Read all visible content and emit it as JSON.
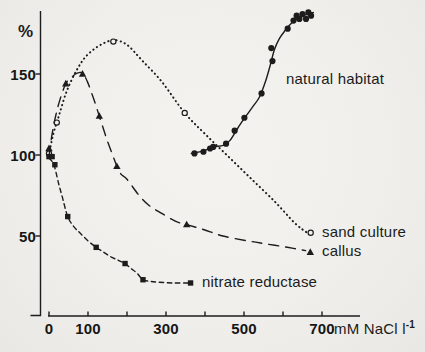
{
  "colors": {
    "ink": "#1c1c1c",
    "paper": "#f2f1ee"
  },
  "labels": {
    "natural_habitat": "natural habitat",
    "sand_culture": "sand culture",
    "callus": "callus",
    "nitrate_reductase": "nitrate reductase"
  },
  "chart_data": {
    "type": "line",
    "title": "",
    "xlabel": "mM NaCl l-1",
    "ylabel": "%",
    "xlim": [
      0,
      790
    ],
    "ylim": [
      0,
      190
    ],
    "grid": false,
    "legend_position": "inline-at-line-ends",
    "x_axis": {
      "unit_base": "mM NaCl l",
      "unit_sup": "-1",
      "tick_values": [
        0,
        100,
        200,
        300,
        400,
        500,
        600,
        700
      ],
      "label_values": [
        0,
        100,
        300,
        500,
        700
      ]
    },
    "y_axis": {
      "symbol": "%",
      "tick_values": [
        50,
        100,
        150
      ]
    },
    "series": [
      {
        "name": "natural habitat",
        "line_style": "solid",
        "marker": "filled-circle",
        "points": [
          [
            373,
            101
          ],
          [
            396,
            102
          ],
          [
            413,
            104
          ],
          [
            421,
            105
          ],
          [
            454,
            107
          ],
          [
            476,
            115
          ],
          [
            501,
            123
          ],
          [
            545,
            138
          ],
          [
            570,
            166
          ],
          [
            573,
            158
          ],
          [
            612,
            178
          ],
          [
            627,
            183
          ],
          [
            635,
            186
          ],
          [
            642,
            184
          ],
          [
            650,
            187
          ],
          [
            659,
            184
          ],
          [
            665,
            188
          ],
          [
            672,
            186
          ]
        ],
        "trend": [
          [
            365,
            101
          ],
          [
            396,
            102.5
          ],
          [
            421,
            105
          ],
          [
            447,
            106
          ],
          [
            464,
            109
          ],
          [
            485,
            117
          ],
          [
            502,
            123
          ],
          [
            523,
            130
          ],
          [
            540,
            136
          ],
          [
            556,
            146
          ],
          [
            568,
            156
          ],
          [
            578,
            165
          ],
          [
            591,
            172
          ],
          [
            606,
            177
          ],
          [
            624,
            182
          ],
          [
            642,
            185
          ],
          [
            662,
            187
          ],
          [
            678,
            188
          ]
        ]
      },
      {
        "name": "sand culture",
        "line_style": "dotted",
        "marker": "open-circle",
        "points": [
          [
            0,
            101
          ],
          [
            20,
            120
          ],
          [
            165,
            170
          ],
          [
            348,
            126
          ],
          [
            671,
            52
          ]
        ],
        "trend": [
          [
            0,
            100
          ],
          [
            10,
            112
          ],
          [
            25,
            124
          ],
          [
            45,
            139
          ],
          [
            70,
            152
          ],
          [
            95,
            161
          ],
          [
            125,
            167
          ],
          [
            150,
            170
          ],
          [
            168,
            171
          ],
          [
            200,
            168
          ],
          [
            240,
            158
          ],
          [
            290,
            145
          ],
          [
            348,
            126
          ],
          [
            400,
            113
          ],
          [
            460,
            99
          ],
          [
            520,
            85
          ],
          [
            580,
            71
          ],
          [
            630,
            58
          ],
          [
            662,
            52
          ]
        ]
      },
      {
        "name": "callus",
        "line_style": "long-dash",
        "marker": "filled-triangle",
        "points": [
          [
            0,
            104
          ],
          [
            43,
            144
          ],
          [
            86,
            150
          ],
          [
            129,
            124
          ],
          [
            174,
            93
          ],
          [
            353,
            57
          ],
          [
            670,
            40
          ]
        ],
        "trend": [
          [
            0,
            99
          ],
          [
            8,
            113
          ],
          [
            18,
            125
          ],
          [
            28,
            134
          ],
          [
            43,
            144
          ],
          [
            58,
            148
          ],
          [
            72,
            150.5
          ],
          [
            86,
            150.5
          ],
          [
            99,
            145
          ],
          [
            114,
            135
          ],
          [
            129,
            124
          ],
          [
            145,
            112
          ],
          [
            160,
            102
          ],
          [
            174,
            93
          ],
          [
            185,
            88
          ],
          [
            200,
            85
          ],
          [
            231,
            75
          ],
          [
            256,
            69
          ],
          [
            289,
            64
          ],
          [
            325,
            59
          ],
          [
            353,
            57
          ],
          [
            396,
            54
          ],
          [
            446,
            50
          ],
          [
            510,
            47
          ],
          [
            560,
            45
          ],
          [
            611,
            43
          ],
          [
            658,
            41
          ]
        ]
      },
      {
        "name": "nitrate reductase",
        "line_style": "short-dash",
        "marker": "filled-square",
        "points": [
          [
            0,
            99
          ],
          [
            8,
            99
          ],
          [
            15,
            94
          ],
          [
            48,
            62
          ],
          [
            121,
            43
          ],
          [
            195,
            33
          ],
          [
            241,
            23
          ],
          [
            363,
            21
          ]
        ],
        "trend": [
          [
            0,
            98
          ],
          [
            8,
            96
          ],
          [
            15,
            92
          ],
          [
            25,
            82
          ],
          [
            33,
            75
          ],
          [
            48,
            62
          ],
          [
            63,
            56
          ],
          [
            79,
            52
          ],
          [
            100,
            47
          ],
          [
            121,
            43
          ],
          [
            140,
            40
          ],
          [
            160,
            37
          ],
          [
            178,
            35
          ],
          [
            195,
            33
          ],
          [
            210,
            30
          ],
          [
            226,
            27
          ],
          [
            241,
            23
          ],
          [
            260,
            22
          ],
          [
            282,
            21.5
          ],
          [
            320,
            21
          ],
          [
            363,
            21
          ]
        ]
      }
    ]
  }
}
